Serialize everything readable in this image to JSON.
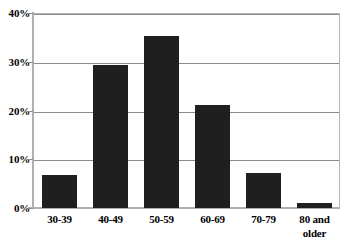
{
  "chart_data": {
    "type": "bar",
    "title": "",
    "subtitle": "",
    "xlabel": "",
    "ylabel": "",
    "categories": [
      "30-39",
      "40-49",
      "50-59",
      "60-69",
      "70-79",
      "80 and older"
    ],
    "category_lines": [
      [
        "30-39"
      ],
      [
        "40-49"
      ],
      [
        "50-59"
      ],
      [
        "60-69"
      ],
      [
        "70-79"
      ],
      [
        "80 and",
        "older"
      ]
    ],
    "values": [
      6.7,
      29.3,
      35.2,
      21.1,
      7.1,
      1.0
    ],
    "value_labels": [
      "",
      "",
      "",
      "",
      "",
      ""
    ],
    "ylim": [
      0,
      40
    ],
    "ytick_values": [
      0,
      10,
      20,
      30,
      40
    ],
    "ytick_labels": [
      "0%",
      "10%",
      "20%",
      "30%",
      "40%"
    ],
    "grid": true,
    "grid_axis": "y",
    "legend": false,
    "legend_position": "none",
    "bar_color": "#1f1f1f",
    "grid_color": "#8c8c8c",
    "axis_color": "#b0b0b0",
    "background_color": "#ffffff"
  }
}
